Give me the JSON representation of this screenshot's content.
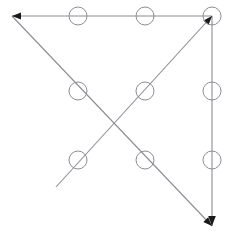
{
  "figure": {
    "width": 234,
    "height": 244,
    "background_color": "#ffffff"
  },
  "style": {
    "line_color": "#8c8c96",
    "line_width": 1.1,
    "dot_stroke_color": "#8c8c96",
    "dot_stroke_width": 1.0,
    "dot_fill": "none",
    "arrow_color": "#1a1a1a"
  },
  "chart_data": {
    "type": "scatter",
    "title": "",
    "xlabel": "",
    "ylabel": "",
    "xlim": [
      0,
      234
    ],
    "ylim": [
      0,
      244
    ],
    "grid": false,
    "legend": "none",
    "dots": {
      "label": "nine-dot-grid",
      "radius": 9,
      "columns_x": [
        78,
        145,
        212
      ],
      "rows_y": [
        16,
        91,
        160
      ],
      "points": [
        {
          "name": "dot-top-left",
          "x": 78,
          "y": 16
        },
        {
          "name": "dot-top-center",
          "x": 145,
          "y": 16
        },
        {
          "name": "dot-top-right",
          "x": 212,
          "y": 16
        },
        {
          "name": "dot-middle-left",
          "x": 78,
          "y": 91
        },
        {
          "name": "dot-middle-center",
          "x": 145,
          "y": 91
        },
        {
          "name": "dot-middle-right",
          "x": 212,
          "y": 91
        },
        {
          "name": "dot-bottom-left",
          "x": 78,
          "y": 160
        },
        {
          "name": "dot-bottom-center",
          "x": 145,
          "y": 160
        },
        {
          "name": "dot-bottom-right",
          "x": 212,
          "y": 160
        }
      ]
    },
    "strokes": [
      {
        "name": "stroke-diagonal-up-right",
        "points": "56,187 212,16",
        "arrow_at_end": true,
        "arrow_angle_deg": -48
      },
      {
        "name": "stroke-horizontal-left",
        "points": "212,16 12,16",
        "arrow_at_end": true,
        "arrow_angle_deg": 180
      },
      {
        "name": "stroke-diagonal-down-right",
        "points": "12,16 212,226",
        "arrow_at_end": true,
        "arrow_angle_deg": 46
      },
      {
        "name": "stroke-vertical-down",
        "points": "212,16 212,226",
        "arrow_at_end": true,
        "arrow_angle_deg": 90
      }
    ]
  }
}
